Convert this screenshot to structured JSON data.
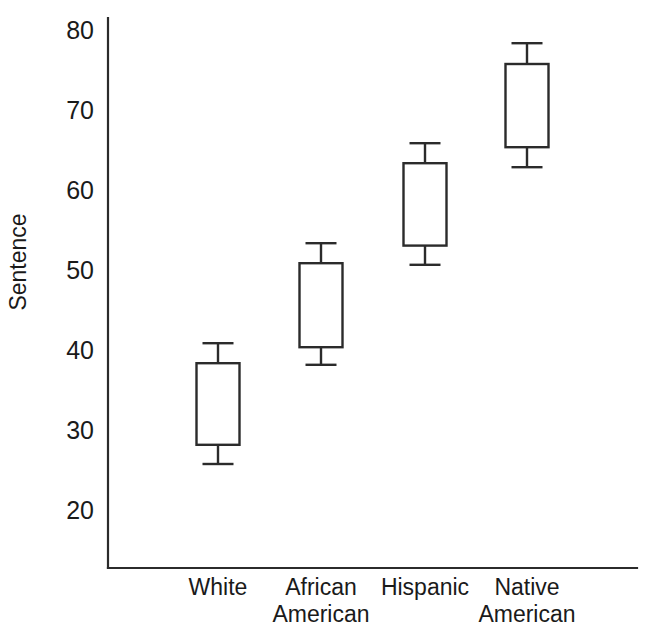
{
  "chart_data": {
    "type": "box",
    "title": "",
    "xlabel": "",
    "ylabel": "Sentence",
    "ylim": [
      16,
      82
    ],
    "yticks": [
      20,
      30,
      40,
      50,
      60,
      70,
      80
    ],
    "ytick_labels": [
      "20",
      "30",
      "40",
      "50",
      "60",
      "70",
      "80"
    ],
    "grid": false,
    "legend": "none",
    "categories": [
      "White",
      "African American",
      "Hispanic",
      "Native American"
    ],
    "category_label_lines": [
      [
        "White"
      ],
      [
        "African",
        "American"
      ],
      [
        "Hispanic"
      ],
      [
        "Native",
        "American"
      ]
    ],
    "boxes": [
      {
        "category": "White",
        "whisker_low": 26.0,
        "q1": 28.4,
        "q3": 38.6,
        "whisker_high": 41.1
      },
      {
        "category": "African American",
        "whisker_low": 38.4,
        "q1": 40.6,
        "q3": 51.1,
        "whisker_high": 53.6
      },
      {
        "category": "Hispanic",
        "whisker_low": 50.9,
        "q1": 53.3,
        "q3": 63.6,
        "whisker_high": 66.1
      },
      {
        "category": "Native American",
        "whisker_low": 63.1,
        "q1": 65.6,
        "q3": 76.0,
        "whisker_high": 78.6
      }
    ],
    "colors": {
      "line": "#2b2b2b",
      "fill": "#ffffff",
      "background": "#ffffff",
      "text": "#1a1a1a"
    }
  }
}
